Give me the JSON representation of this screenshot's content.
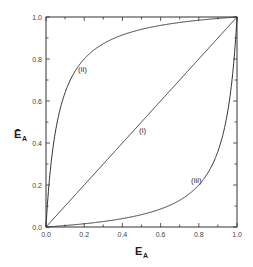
{
  "chart_data": {
    "type": "line",
    "title": "",
    "xlabel": "E_A",
    "ylabel": "Ē_A",
    "xlim": [
      0.0,
      1.0
    ],
    "ylim": [
      0.0,
      1.0
    ],
    "grid": false,
    "legend": "none (inline curve labels)",
    "x_ticks": [
      "0.0",
      "0.2",
      "0.4",
      "0.6",
      "0.8",
      "1.0"
    ],
    "y_ticks": [
      "0.0",
      "0.2",
      "0.4",
      "0.6",
      "0.8",
      "1.0"
    ],
    "series": [
      {
        "name": "(i)",
        "x": [
          0.0,
          0.2,
          0.4,
          0.6,
          0.8,
          1.0
        ],
        "values": [
          0.0,
          0.2,
          0.4,
          0.6,
          0.8,
          1.0
        ],
        "label_pos": [
          0.51,
          0.46
        ]
      },
      {
        "name": "(ii)",
        "x": [
          0.0,
          0.02,
          0.05,
          0.1,
          0.2,
          0.3,
          0.4,
          0.6,
          0.8,
          1.0
        ],
        "values": [
          0.0,
          0.25,
          0.46,
          0.64,
          0.8,
          0.87,
          0.91,
          0.96,
          0.985,
          1.0
        ],
        "label_pos": [
          0.2,
          0.75
        ]
      },
      {
        "name": "(iii)",
        "x": [
          0.0,
          0.2,
          0.4,
          0.6,
          0.7,
          0.8,
          0.9,
          0.95,
          0.98,
          1.0
        ],
        "values": [
          0.0,
          0.015,
          0.04,
          0.09,
          0.13,
          0.2,
          0.36,
          0.54,
          0.75,
          1.0
        ],
        "label_pos": [
          0.79,
          0.22
        ]
      }
    ]
  },
  "labels": {
    "x_axis": "E",
    "x_axis_sub": "A",
    "y_axis": "Ē",
    "y_axis_sub": "A",
    "curve_i": "(i)",
    "curve_ii": "(ii)",
    "curve_iii": "(iii)",
    "xt0": "0.0",
    "xt1": "0.2",
    "xt2": "0.4",
    "xt3": "0.6",
    "xt4": "0.8",
    "xt5": "1.0",
    "yt0": "0.0",
    "yt1": "0.2",
    "yt2": "0.4",
    "yt3": "0.6",
    "yt4": "0.8",
    "yt5": "1.0"
  }
}
